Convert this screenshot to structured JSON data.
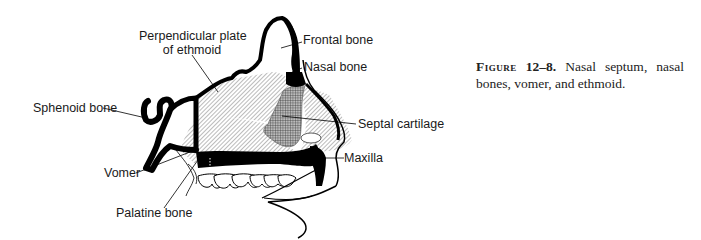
{
  "figure": {
    "labels": {
      "perpendicular_plate_line1": "Perpendicular plate",
      "perpendicular_plate_line2": "of ethmoid",
      "frontal_bone": "Frontal bone",
      "nasal_bone": "Nasal bone",
      "sphenoid_bone": "Sphenoid bone",
      "septal_cartilage": "Septal cartilage",
      "maxilla": "Maxilla",
      "vomer": "Vomer",
      "palatine_bone": "Palatine bone"
    },
    "caption": {
      "prefix": "Figure",
      "number": "12–8.",
      "text": "Nasal septum, nasal bones, vomer, and ethmoid."
    }
  }
}
